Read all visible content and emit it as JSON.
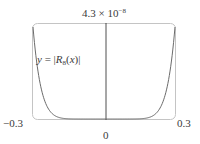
{
  "chart_data": {
    "type": "line",
    "title": "",
    "function_label": "y = |R8(x)|",
    "function_label_parts": {
      "prefix": "y = |",
      "name": "R",
      "subscript": "8",
      "arg": "(x)",
      "suffix": "|"
    },
    "xlabel": "",
    "ylabel": "",
    "xlim": [
      -0.3,
      0.3
    ],
    "ylim": [
      0,
      4.3e-08
    ],
    "x_tick_labels": {
      "min": "−0.3",
      "mid": "0",
      "max": "0.3"
    },
    "y_max_label": {
      "mantissa": "4.3 × 10",
      "exponent": "−8"
    },
    "x": [
      -0.3,
      -0.27,
      -0.24,
      -0.21,
      -0.18,
      -0.15,
      -0.12,
      -0.09,
      -0.06,
      -0.03,
      0,
      0.03,
      0.06,
      0.09,
      0.12,
      0.15,
      0.18,
      0.21,
      0.24,
      0.27,
      0.3
    ],
    "y": [
      4.3e-08,
      1.85e-08,
      7.2e-09,
      2.5e-09,
      7.5e-10,
      1.7e-10,
      2.8e-11,
      2.8e-12,
      1.1e-13,
      4e-16,
      0,
      4e-16,
      1.1e-13,
      2.8e-12,
      2.8e-11,
      1.7e-10,
      7.5e-10,
      2.5e-09,
      7.2e-09,
      1.85e-08,
      4.3e-08
    ],
    "grid": false,
    "legend": null,
    "colors": {
      "curve": "#6b6b6b",
      "frame": "#bdbdbd",
      "axis": "#222222"
    }
  }
}
